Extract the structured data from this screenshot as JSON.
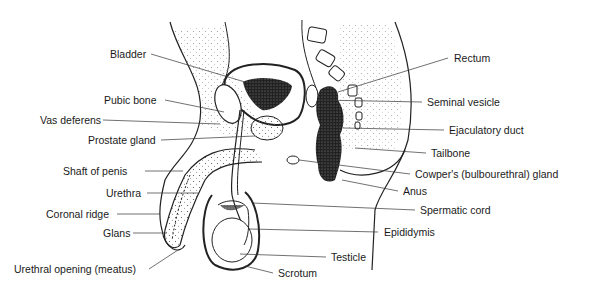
{
  "diagram": {
    "labels_left": [
      {
        "text": "Bladder",
        "x": 110,
        "y": 48
      },
      {
        "text": "Pubic bone",
        "x": 104,
        "y": 94
      },
      {
        "text": "Vas deferens",
        "x": 40,
        "y": 114
      },
      {
        "text": "Prostate gland",
        "x": 88,
        "y": 134
      },
      {
        "text": "Shaft of penis",
        "x": 63,
        "y": 165
      },
      {
        "text": "Urethra",
        "x": 106,
        "y": 187
      },
      {
        "text": "Coronal ridge",
        "x": 46,
        "y": 208
      },
      {
        "text": "Glans",
        "x": 103,
        "y": 227
      },
      {
        "text": "Urethral opening (meatus)",
        "x": 14,
        "y": 263
      }
    ],
    "labels_right": [
      {
        "text": "Rectum",
        "x": 454,
        "y": 52
      },
      {
        "text": "Seminal vesicle",
        "x": 427,
        "y": 96
      },
      {
        "text": "Ejaculatory duct",
        "x": 449,
        "y": 124
      },
      {
        "text": "Tailbone",
        "x": 431,
        "y": 147
      },
      {
        "text": "Cowper's (bulbourethral) gland",
        "x": 415,
        "y": 168
      },
      {
        "text": "Anus",
        "x": 403,
        "y": 185
      },
      {
        "text": "Spermatic cord",
        "x": 420,
        "y": 204
      },
      {
        "text": "Epididymis",
        "x": 384,
        "y": 226
      },
      {
        "text": "Testicle",
        "x": 331,
        "y": 251
      },
      {
        "text": "Scrotum",
        "x": 278,
        "y": 267
      }
    ]
  }
}
